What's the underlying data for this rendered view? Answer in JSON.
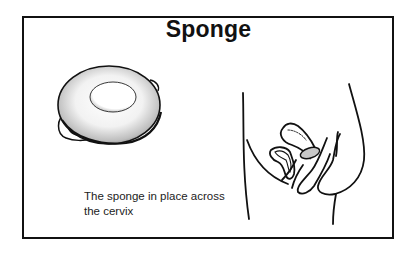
{
  "figure": {
    "title": "Sponge",
    "caption_line1": "The sponge in place across",
    "caption_line2": "the cervix",
    "illustrations": [
      {
        "name": "contraceptive-sponge",
        "description": "Round contraceptive sponge with central dimple and loop"
      },
      {
        "name": "pelvic-cross-section",
        "description": "Side-view cross-section of female pelvis showing sponge placed across the cervix"
      }
    ]
  },
  "colors": {
    "line": "#111111",
    "background": "#ffffff",
    "sponge_shade": "#888888"
  }
}
